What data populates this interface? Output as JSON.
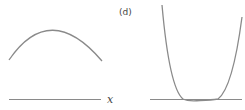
{
  "figure": {
    "panel_label": "(d)",
    "left_panel": {
      "axis_label": "x",
      "curve": "concave-down parabola arc above axis"
    },
    "right_panel": {
      "curve": "quartic-like U curve touching axis with flat bottom"
    },
    "colors": {
      "curve": "#888888",
      "axis": "#888888",
      "text": "#444444"
    }
  }
}
